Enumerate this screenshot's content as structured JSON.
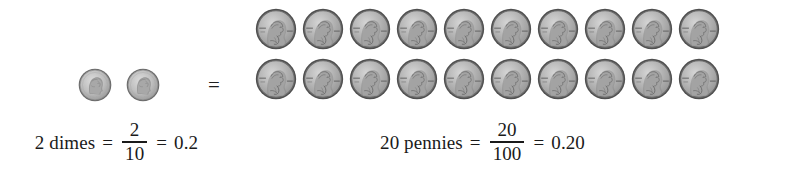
{
  "figure": {
    "background_color": "#ffffff"
  },
  "dimes": {
    "count": 2,
    "coin_label": "dime",
    "coins": [
      {
        "name": "dime-1"
      },
      {
        "name": "dime-2"
      }
    ]
  },
  "equals": {
    "symbol": "="
  },
  "pennies": {
    "count": 20,
    "coin_label": "penny",
    "rows": [
      [
        {
          "name": "penny-1"
        },
        {
          "name": "penny-2"
        },
        {
          "name": "penny-3"
        },
        {
          "name": "penny-4"
        },
        {
          "name": "penny-5"
        },
        {
          "name": "penny-6"
        },
        {
          "name": "penny-7"
        },
        {
          "name": "penny-8"
        },
        {
          "name": "penny-9"
        },
        {
          "name": "penny-10"
        }
      ],
      [
        {
          "name": "penny-11"
        },
        {
          "name": "penny-12"
        },
        {
          "name": "penny-13"
        },
        {
          "name": "penny-14"
        },
        {
          "name": "penny-15"
        },
        {
          "name": "penny-16"
        },
        {
          "name": "penny-17"
        },
        {
          "name": "penny-18"
        },
        {
          "name": "penny-19"
        },
        {
          "name": "penny-20"
        }
      ]
    ]
  },
  "caption_dimes": {
    "label": "2 dimes",
    "equals_1": "=",
    "numerator": "2",
    "denominator": "10",
    "equals_2": "=",
    "decimal": "0.2"
  },
  "caption_pennies": {
    "label": "20 pennies",
    "equals_1": "=",
    "numerator": "20",
    "denominator": "100",
    "equals_2": "=",
    "decimal": "0.20"
  },
  "colors": {
    "text": "#1a1a1a",
    "coin_face": "#b9b9b9",
    "coin_rim": "#5a5a5a",
    "coin_shadow": "#7d7d7d",
    "coin_highlight": "#d8d8d8"
  }
}
